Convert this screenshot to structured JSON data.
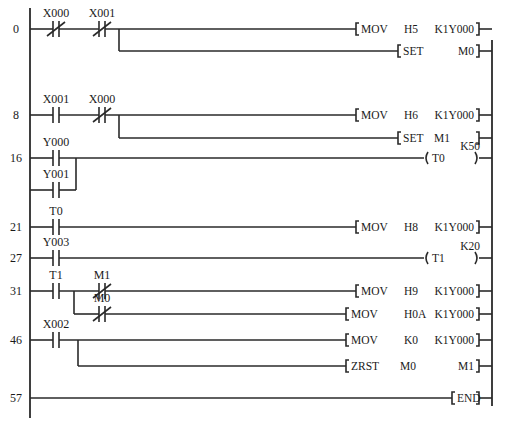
{
  "diagram": {
    "type": "plc-ladder-diagram",
    "rails": {
      "left_x": 30,
      "right_x": 492,
      "top_y": 8,
      "bottom_y": 418
    },
    "rungs": [
      {
        "step": "0",
        "y": 29,
        "contacts": [
          {
            "label": "X000",
            "type": "NC",
            "x": 48,
            "y": 29
          },
          {
            "label": "X001",
            "type": "NC",
            "x": 94,
            "y": 29
          }
        ],
        "outputs": [
          {
            "kind": "instr",
            "y": 29,
            "bx": 356,
            "op": "MOV",
            "a1": "H5",
            "a2": "K1Y000"
          },
          {
            "kind": "instr",
            "y": 51,
            "bx": 398,
            "op": "SET",
            "a1": "",
            "a2": "M0"
          }
        ],
        "branch_x": 119
      },
      {
        "step": "8",
        "y": 115,
        "contacts": [
          {
            "label": "X001",
            "type": "NO",
            "x": 48,
            "y": 115
          },
          {
            "label": "X000",
            "type": "NC",
            "x": 94,
            "y": 115
          }
        ],
        "outputs": [
          {
            "kind": "instr",
            "y": 115,
            "bx": 356,
            "op": "MOV",
            "a1": "H6",
            "a2": "K1Y000"
          },
          {
            "kind": "instr",
            "y": 138,
            "bx": 398,
            "op": "SET",
            "a1": "M1",
            "a2": ""
          }
        ],
        "branch_x": 119
      },
      {
        "step": "16",
        "y": 158,
        "contacts": [
          {
            "label": "Y000",
            "type": "NO",
            "x": 48,
            "y": 158
          },
          {
            "label": "Y001",
            "type": "NO",
            "x": 48,
            "y": 190
          }
        ],
        "outputs": [
          {
            "kind": "coil",
            "y": 158,
            "op": "T0",
            "preset": "K50"
          }
        ]
      },
      {
        "step": "21",
        "y": 227,
        "contacts": [
          {
            "label": "T0",
            "type": "NO",
            "x": 48,
            "y": 227
          }
        ],
        "outputs": [
          {
            "kind": "instr",
            "y": 227,
            "bx": 356,
            "op": "MOV",
            "a1": "H8",
            "a2": "K1Y000"
          }
        ]
      },
      {
        "step": "27",
        "y": 258,
        "contacts": [
          {
            "label": "Y003",
            "type": "NO",
            "x": 48,
            "y": 258
          }
        ],
        "outputs": [
          {
            "kind": "coil",
            "y": 258,
            "op": "T1",
            "preset": "K20"
          }
        ]
      },
      {
        "step": "31",
        "y": 291,
        "contacts": [
          {
            "label": "T1",
            "type": "NO",
            "x": 48,
            "y": 291
          },
          {
            "label": "M1",
            "type": "NC",
            "x": 94,
            "y": 291
          },
          {
            "label": "M0",
            "type": "NC",
            "x": 94,
            "y": 314
          }
        ],
        "outputs": [
          {
            "kind": "instr",
            "y": 291,
            "bx": 356,
            "op": "MOV",
            "a1": "H9",
            "a2": "K1Y000"
          },
          {
            "kind": "instr",
            "y": 314,
            "bx": 346,
            "op": "MOV",
            "a1": "H0A",
            "a2": "K1Y000"
          }
        ]
      },
      {
        "step": "46",
        "y": 340,
        "contacts": [
          {
            "label": "X002",
            "type": "NO",
            "x": 48,
            "y": 340
          }
        ],
        "outputs": [
          {
            "kind": "instr",
            "y": 340,
            "bx": 346,
            "op": "MOV",
            "a1": "K0",
            "a2": "K1Y000"
          },
          {
            "kind": "instr",
            "y": 366,
            "bx": 346,
            "op": "ZRST",
            "a1": "M0",
            "a2": "M1"
          }
        ]
      },
      {
        "step": "57",
        "y": 398,
        "contacts": [],
        "outputs": [
          {
            "kind": "end",
            "y": 398,
            "op": "END"
          }
        ]
      }
    ]
  }
}
